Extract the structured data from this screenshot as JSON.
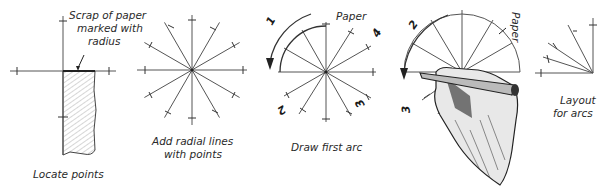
{
  "figure": {
    "panels": [
      {
        "id": "locate-points",
        "caption": "Locate points",
        "annotation": [
          "Scrap of paper",
          "marked with",
          "radius"
        ]
      },
      {
        "id": "add-radial-lines",
        "caption": [
          "Add radial lines",
          "with points"
        ]
      },
      {
        "id": "draw-first-arc",
        "caption": "Draw first arc",
        "annotation": "Paper",
        "step_numbers": [
          "1",
          "2",
          "3",
          "4"
        ]
      },
      {
        "id": "draw-second-arc",
        "annotation": "Paper",
        "step_numbers": [
          "2",
          "3"
        ]
      },
      {
        "id": "layout-for-arcs",
        "caption": [
          "Layout",
          "for arcs"
        ]
      }
    ]
  }
}
